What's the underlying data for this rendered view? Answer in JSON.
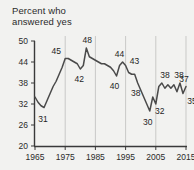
{
  "chart": {
    "title": "Percent who\nanswered yes"
  },
  "chart_data": {
    "type": "line",
    "title": "Percent who answered yes",
    "xlabel": "",
    "ylabel": "",
    "xlim": [
      1965,
      2015
    ],
    "ylim": [
      20,
      50
    ],
    "yticks": [
      20,
      26,
      32,
      38,
      44,
      50
    ],
    "xticks": [
      1965,
      1975,
      1985,
      1995,
      2005,
      2015
    ],
    "grid": "vertical-only",
    "gridlines_x": [
      1975,
      1985,
      1995,
      2005,
      2015
    ],
    "legend": "none",
    "line_color": "#4a4a4a",
    "background_color": "#f2f2f0",
    "axis_color": "#3a3a3a",
    "gridline_color": "#c9c9c7",
    "x": [
      1965,
      1966,
      1967,
      1968,
      1969,
      1970,
      1971,
      1972,
      1973,
      1974,
      1975,
      1976,
      1977,
      1978,
      1979,
      1980,
      1981,
      1982,
      1983,
      1984,
      1985,
      1986,
      1987,
      1988,
      1989,
      1990,
      1991,
      1992,
      1993,
      1994,
      1995,
      1996,
      1997,
      1998,
      1999,
      2000,
      2001,
      2002,
      2003,
      2004,
      2005,
      2006,
      2007,
      2008,
      2009,
      2010,
      2011,
      2012,
      2013,
      2014,
      2015
    ],
    "values": [
      34,
      32.5,
      31.5,
      31,
      33,
      35,
      37,
      38.5,
      40.5,
      42.5,
      45,
      45,
      44.5,
      44,
      43.5,
      42,
      43,
      48,
      45.5,
      45,
      44.5,
      44,
      43.5,
      43.5,
      43,
      42.5,
      41.5,
      40,
      43,
      44,
      43,
      41,
      40.5,
      40.5,
      38,
      36,
      34,
      32,
      30,
      34,
      32,
      37,
      38,
      36.5,
      37.5,
      36.5,
      37.5,
      35.5,
      38,
      35,
      37
    ],
    "annotations": [
      {
        "label": "31",
        "x": 1968,
        "y": 31
      },
      {
        "label": "45",
        "x": 1975,
        "y": 45
      },
      {
        "label": "42",
        "x": 1980,
        "y": 42
      },
      {
        "label": "48",
        "x": 1982,
        "y": 48
      },
      {
        "label": "40",
        "x": 1992,
        "y": 40
      },
      {
        "label": "44",
        "x": 1994,
        "y": 44
      },
      {
        "label": "43",
        "x": 1995,
        "y": 43
      },
      {
        "label": "38",
        "x": 1999,
        "y": 38
      },
      {
        "label": "30",
        "x": 2003,
        "y": 30
      },
      {
        "label": "32",
        "x": 2005,
        "y": 32
      },
      {
        "label": "38",
        "x": 2008,
        "y": 38
      },
      {
        "label": "38",
        "x": 2013,
        "y": 38
      },
      {
        "label": "37",
        "x": 2015,
        "y": 37
      },
      {
        "label": "35",
        "x": 2014,
        "y": 35
      }
    ]
  }
}
